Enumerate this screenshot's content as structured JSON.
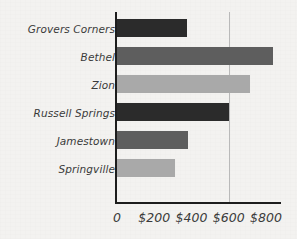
{
  "chart_data": {
    "type": "bar",
    "orientation": "horizontal",
    "title": "",
    "xlabel": "",
    "ylabel": "",
    "categories": [
      "Grovers Corners",
      "Bethel",
      "Zion",
      "Russell Springs",
      "Jamestown",
      "Springville"
    ],
    "values": [
      375,
      840,
      712,
      600,
      380,
      310
    ],
    "xlim": [
      0,
      875
    ],
    "xticks": [
      0,
      200,
      400,
      600,
      800
    ],
    "xticklabels": [
      "0",
      "$200",
      "$400",
      "$600",
      "$800"
    ],
    "grid": "vertical-at-600-only",
    "legend": "none",
    "bar_colors": [
      "#2b2b2b",
      "#5e5e5e",
      "#a9a9a9",
      "#2b2b2b",
      "#5e5e5e",
      "#a9a9a9"
    ]
  },
  "style": {
    "background": "#f3f2f0",
    "axis_color": "#1d1d1d",
    "gridline_color": "#b9b9b9",
    "text_color": "#3a3a3a"
  }
}
